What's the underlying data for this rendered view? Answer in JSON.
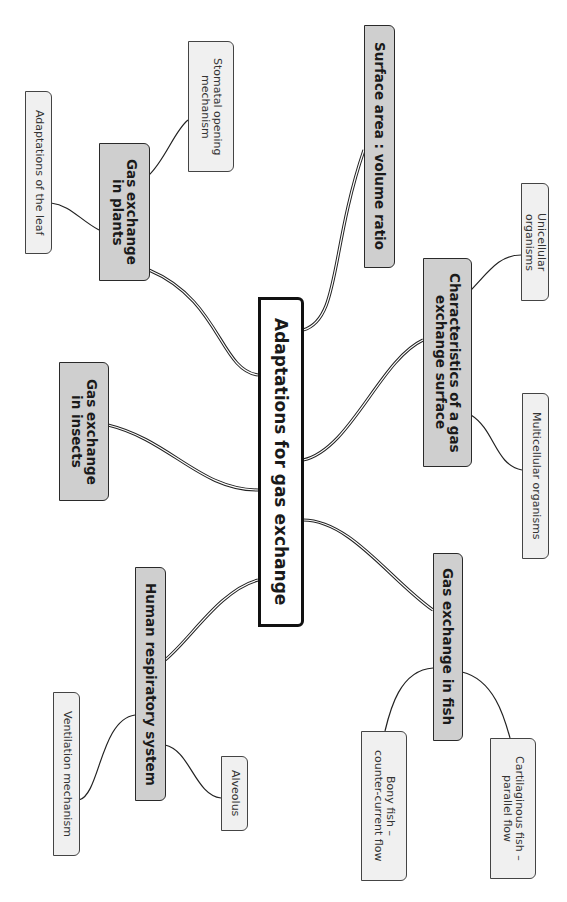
{
  "diagram": {
    "type": "mind-map",
    "orientation": "rotated-90-clockwise",
    "center": {
      "label": "Adaptations for gas exchange"
    },
    "branches": [
      {
        "id": "surface",
        "label": "Surface area  :  volume ratio",
        "children": []
      },
      {
        "id": "characteristics",
        "label": "Characteristics of a gas\nexchange surface",
        "children": [
          {
            "label": "Unicellular organisms"
          },
          {
            "label": "Multicellular organisms"
          }
        ]
      },
      {
        "id": "fish",
        "label": "Gas exchange in fish",
        "children": [
          {
            "label": "Cartilaginous fish –\nparallel flow"
          },
          {
            "label": "Bony fish –\ncounter-current flow"
          }
        ]
      },
      {
        "id": "human",
        "label": "Human respiratory system",
        "children": [
          {
            "label": "Alveolus"
          },
          {
            "label": "Ventilation mechanism"
          }
        ]
      },
      {
        "id": "insects",
        "label": "Gas exchange\nin insects",
        "children": []
      },
      {
        "id": "plants",
        "label": "Gas exchange\nin plants",
        "children": [
          {
            "label": "Stomatal opening\nmechanism"
          },
          {
            "label": "Adaptations of the leaf"
          }
        ]
      }
    ]
  },
  "colors": {
    "center_fill": "#ffffff",
    "main_fill": "#cfcfcf",
    "sub_fill": "#f0f0f0",
    "line": "#222222"
  }
}
